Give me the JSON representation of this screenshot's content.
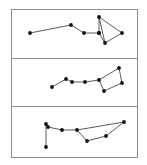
{
  "figure": {
    "title": "",
    "background_color": "#ffffff",
    "frame_color": "#8d8d8d",
    "node_color": "#111111",
    "edge_color": "#141414",
    "width": 147,
    "height": 165,
    "frame": {
      "x": 11,
      "y": 9,
      "width": 126,
      "height": 148
    },
    "dividers_y": [
      58,
      106
    ]
  },
  "chart_data": {
    "type": "scatter",
    "title": "",
    "xlabel": "",
    "ylabel": "",
    "grid": false,
    "legend": "none",
    "xlim": [
      11,
      137
    ],
    "ylim": [
      9,
      157
    ],
    "panels": [
      {
        "name": "panel-top",
        "index": 1,
        "label": "",
        "bounds": {
          "x": 11,
          "y": 9,
          "width": 126,
          "height": 49
        },
        "node_count": 8,
        "edge_count": 8,
        "nodes": [
          {
            "id": "p1n0",
            "x": 30,
            "y": 33
          },
          {
            "id": "p1n1",
            "x": 71,
            "y": 25
          },
          {
            "id": "p1n2",
            "x": 84,
            "y": 33
          },
          {
            "id": "p1n3",
            "x": 99,
            "y": 33
          },
          {
            "id": "p1n4",
            "x": 99,
            "y": 17
          },
          {
            "id": "p1n5",
            "x": 105,
            "y": 43
          },
          {
            "id": "p1n6",
            "x": 122,
            "y": 33
          },
          {
            "id": "p1n7",
            "x": 99,
            "y": 33
          }
        ],
        "edges": [
          {
            "from": "p1n0",
            "to": "p1n1"
          },
          {
            "from": "p1n1",
            "to": "p1n2"
          },
          {
            "from": "p1n2",
            "to": "p1n3"
          },
          {
            "from": "p1n3",
            "to": "p1n4"
          },
          {
            "from": "p1n3",
            "to": "p1n5"
          },
          {
            "from": "p1n4",
            "to": "p1n5"
          },
          {
            "from": "p1n4",
            "to": "p1n6"
          },
          {
            "from": "p1n5",
            "to": "p1n6"
          }
        ]
      },
      {
        "name": "panel-middle",
        "index": 2,
        "label": "",
        "bounds": {
          "x": 11,
          "y": 58,
          "width": 126,
          "height": 48
        },
        "node_count": 7,
        "edge_count": 7,
        "nodes": [
          {
            "id": "p2n0",
            "x": 52,
            "y": 87
          },
          {
            "id": "p2n1",
            "x": 66,
            "y": 79
          },
          {
            "id": "p2n2",
            "x": 72,
            "y": 82
          },
          {
            "id": "p2n3",
            "x": 85,
            "y": 82
          },
          {
            "id": "p2n4",
            "x": 99,
            "y": 80
          },
          {
            "id": "p2n5",
            "x": 104,
            "y": 91
          },
          {
            "id": "p2n6",
            "x": 119,
            "y": 68
          },
          {
            "id": "p2n7",
            "x": 122,
            "y": 83
          }
        ],
        "edges": [
          {
            "from": "p2n0",
            "to": "p2n1"
          },
          {
            "from": "p2n1",
            "to": "p2n2"
          },
          {
            "from": "p2n2",
            "to": "p2n3"
          },
          {
            "from": "p2n3",
            "to": "p2n4"
          },
          {
            "from": "p2n4",
            "to": "p2n5"
          },
          {
            "from": "p2n4",
            "to": "p2n6"
          },
          {
            "from": "p2n6",
            "to": "p2n7"
          },
          {
            "from": "p2n5",
            "to": "p2n7"
          }
        ]
      },
      {
        "name": "panel-bottom",
        "index": 3,
        "label": "",
        "bounds": {
          "x": 11,
          "y": 106,
          "width": 126,
          "height": 51
        },
        "node_count": 8,
        "edge_count": 8,
        "nodes": [
          {
            "id": "p3n0",
            "x": 46,
            "y": 147
          },
          {
            "id": "p3n1",
            "x": 46,
            "y": 124
          },
          {
            "id": "p3n2",
            "x": 48,
            "y": 127
          },
          {
            "id": "p3n3",
            "x": 62,
            "y": 130
          },
          {
            "id": "p3n4",
            "x": 77,
            "y": 130
          },
          {
            "id": "p3n5",
            "x": 87,
            "y": 141
          },
          {
            "id": "p3n6",
            "x": 106,
            "y": 136
          },
          {
            "id": "p3n7",
            "x": 124,
            "y": 122
          }
        ],
        "edges": [
          {
            "from": "p3n0",
            "to": "p3n1"
          },
          {
            "from": "p3n1",
            "to": "p3n2"
          },
          {
            "from": "p3n2",
            "to": "p3n3"
          },
          {
            "from": "p3n3",
            "to": "p3n4"
          },
          {
            "from": "p3n4",
            "to": "p3n5"
          },
          {
            "from": "p3n4",
            "to": "p3n7"
          },
          {
            "from": "p3n5",
            "to": "p3n6"
          },
          {
            "from": "p3n6",
            "to": "p3n7"
          }
        ]
      }
    ]
  }
}
